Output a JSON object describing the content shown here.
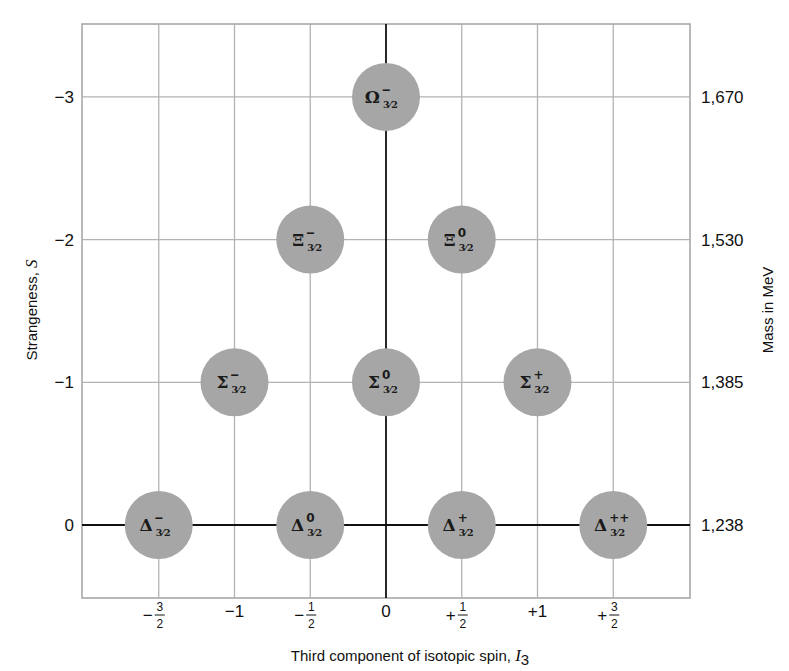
{
  "chart_data": {
    "type": "scatter",
    "xlabel": "Third component of isotopic spin, I3",
    "xlabel_text": "Third component of isotopic spin, ",
    "xlabel_symbol": "I",
    "xlabel_symbol_sub": "3",
    "ylabel": "Strangeness, S",
    "ylabel_text": "Strangeness, ",
    "ylabel_symbol": "S",
    "y2label": "Mass in MeV",
    "xlim": [
      -2,
      2
    ],
    "ylim": [
      0.5,
      -3.5
    ],
    "grid": true,
    "x_ticks": [
      {
        "value": -1.5,
        "sign": "−",
        "whole": "",
        "num": "3",
        "den": "2",
        "label": "-3/2"
      },
      {
        "value": -1,
        "sign": "−",
        "whole": "1",
        "num": "",
        "den": "",
        "label": "-1"
      },
      {
        "value": -0.5,
        "sign": "−",
        "whole": "",
        "num": "1",
        "den": "2",
        "label": "-1/2"
      },
      {
        "value": 0,
        "sign": "",
        "whole": "0",
        "num": "",
        "den": "",
        "label": "0"
      },
      {
        "value": 0.5,
        "sign": "+",
        "whole": "",
        "num": "1",
        "den": "2",
        "label": "+1/2"
      },
      {
        "value": 1,
        "sign": "+",
        "whole": "1",
        "num": "",
        "den": "",
        "label": "+1"
      },
      {
        "value": 1.5,
        "sign": "+",
        "whole": "",
        "num": "3",
        "den": "2",
        "label": "+3/2"
      }
    ],
    "y_ticks": [
      {
        "value": -3,
        "label": "−3"
      },
      {
        "value": -2,
        "label": "−2"
      },
      {
        "value": -1,
        "label": "−1"
      },
      {
        "value": 0,
        "label": "0"
      }
    ],
    "y2_ticks": [
      {
        "strangeness": -3,
        "label": "1,670",
        "mass_mev": 1670
      },
      {
        "strangeness": -2,
        "label": "1,530",
        "mass_mev": 1530
      },
      {
        "strangeness": -1,
        "label": "1,385",
        "mass_mev": 1385
      },
      {
        "strangeness": 0,
        "label": "1,238",
        "mass_mev": 1238
      }
    ],
    "points": [
      {
        "name": "Omega-",
        "symbol": "Ω",
        "charge": "–",
        "spin": "3/2",
        "I3": 0,
        "S": -3,
        "mass_mev": 1670
      },
      {
        "name": "Xi-",
        "symbol": "Ξ",
        "charge": "–",
        "spin": "3/2",
        "I3": -0.5,
        "S": -2,
        "mass_mev": 1530
      },
      {
        "name": "Xi0",
        "symbol": "Ξ",
        "charge": "0",
        "spin": "3/2",
        "I3": 0.5,
        "S": -2,
        "mass_mev": 1530
      },
      {
        "name": "Sigma-",
        "symbol": "Σ",
        "charge": "–",
        "spin": "3/2",
        "I3": -1,
        "S": -1,
        "mass_mev": 1385
      },
      {
        "name": "Sigma0",
        "symbol": "Σ",
        "charge": "0",
        "spin": "3/2",
        "I3": 0,
        "S": -1,
        "mass_mev": 1385
      },
      {
        "name": "Sigma+",
        "symbol": "Σ",
        "charge": "+",
        "spin": "3/2",
        "I3": 1,
        "S": -1,
        "mass_mev": 1385
      },
      {
        "name": "Delta-",
        "symbol": "Δ",
        "charge": "–",
        "spin": "3/2",
        "I3": -1.5,
        "S": 0,
        "mass_mev": 1238
      },
      {
        "name": "Delta0",
        "symbol": "Δ",
        "charge": "0",
        "spin": "3/2",
        "I3": -0.5,
        "S": 0,
        "mass_mev": 1238
      },
      {
        "name": "Delta+",
        "symbol": "Δ",
        "charge": "+",
        "spin": "3/2",
        "I3": 0.5,
        "S": 0,
        "mass_mev": 1238
      },
      {
        "name": "Delta++",
        "symbol": "Δ",
        "charge": "++",
        "spin": "3/2",
        "I3": 1.5,
        "S": 0,
        "mass_mev": 1238
      }
    ],
    "colors": {
      "particle_fill": "#a6a6a6",
      "grid_line": "#b3b3b3",
      "axis_line": "#111111",
      "frame": "#a8a8a8"
    }
  }
}
